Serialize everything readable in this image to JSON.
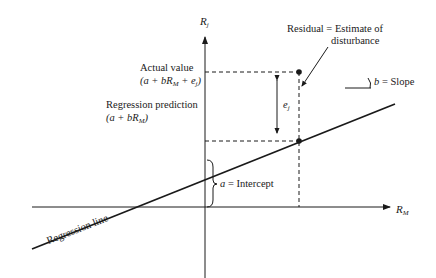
{
  "axes": {
    "y_label": "R",
    "y_label_sub": "j",
    "x_label": "R",
    "x_label_sub": "M"
  },
  "labels": {
    "actual_value_title": "Actual value",
    "actual_value_formula": "(a + bR",
    "actual_value_formula_sub": "M",
    "actual_value_formula_tail": " + e",
    "actual_value_formula_sub2": "j",
    "actual_value_close": ")",
    "prediction_title": "Regression prediction",
    "prediction_formula": "(a + bR",
    "prediction_formula_sub": "M",
    "prediction_close": ")",
    "residual_line1": "Residual = Estimate of",
    "residual_line2": "disturbance",
    "residual_symbol": "e",
    "residual_symbol_sub": "j",
    "slope_label": "b = Slope",
    "intercept_label": "a = Intercept",
    "regression_line_label": "Regression line"
  },
  "colors": {
    "ink": "#1a1a1a",
    "background": "#ffffff"
  }
}
